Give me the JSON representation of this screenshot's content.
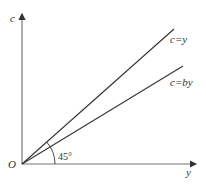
{
  "diagram": {
    "axes": {
      "vertical_label": "c",
      "horizontal_label": "y",
      "origin_label": "O"
    },
    "lines": [
      {
        "label": "c=y",
        "description": "45-degree line"
      },
      {
        "label": "c=by",
        "description": "lower-slope line"
      }
    ],
    "angle": {
      "label": "45°"
    },
    "colors": {
      "axis": "#555555",
      "line": "#333333",
      "text": "#333333"
    }
  }
}
